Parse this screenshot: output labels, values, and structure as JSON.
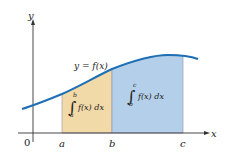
{
  "diagram": {
    "axis_labels": {
      "x": "x",
      "y": "y",
      "origin": "0"
    },
    "curve_label": "y = f(x)",
    "x_ticks": [
      "a",
      "b",
      "c"
    ],
    "regions": [
      {
        "name": "a-to-b",
        "lower": "a",
        "upper": "b",
        "integrand": "f(x) dx",
        "color": "#f2d9a8"
      },
      {
        "name": "b-to-c",
        "lower": "b",
        "upper": "c",
        "integrand": "f(x) dx",
        "color": "#b4cfe9"
      }
    ],
    "curve_color": "#1f6fb5"
  }
}
